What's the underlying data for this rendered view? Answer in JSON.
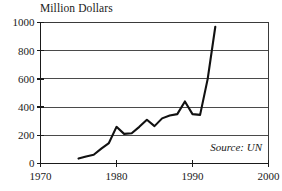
{
  "chart_data": {
    "type": "line",
    "title": "Million Dollars",
    "xlabel": "",
    "ylabel": "Million Dollars",
    "xlim": [
      1970,
      2000
    ],
    "ylim": [
      0,
      1000
    ],
    "grid": true,
    "legend": "none",
    "annotations": [
      {
        "name": "source",
        "text": "Source: UN",
        "style": "italic",
        "position": "bottom-right-inside"
      }
    ],
    "xticks": [
      1970,
      1980,
      1990,
      2000
    ],
    "xtick_labels": [
      "1970",
      "1980",
      "1990",
      "2000"
    ],
    "yticks": [
      0,
      200,
      400,
      600,
      800,
      1000
    ],
    "ytick_labels": [
      "0",
      "200",
      "400",
      "600",
      "800",
      "1000"
    ],
    "series": [
      {
        "name": "Value",
        "x": [
          1975,
          1976,
          1977,
          1978,
          1979,
          1980,
          1981,
          1982,
          1983,
          1984,
          1985,
          1986,
          1987,
          1988,
          1989,
          1990,
          1991,
          1992,
          1993
        ],
        "values": [
          35,
          50,
          62,
          105,
          145,
          260,
          210,
          215,
          260,
          310,
          265,
          320,
          340,
          350,
          440,
          350,
          345,
          600,
          970
        ]
      }
    ]
  },
  "axis_colors": {
    "gridline": "#4a4a4a",
    "axis": "#1a1a1a",
    "line": "#111111",
    "background": "#ffffff"
  }
}
